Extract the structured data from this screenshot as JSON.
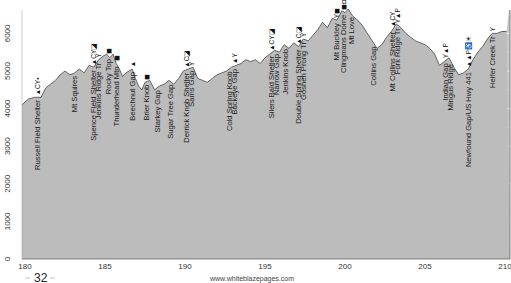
{
  "chart_data": {
    "type": "area",
    "title": "",
    "xlabel": "",
    "ylabel": "",
    "xlim": [
      180,
      210
    ],
    "ylim": [
      0,
      6400
    ],
    "x_ticks": [
      180,
      185,
      190,
      195,
      200,
      205,
      210
    ],
    "y_ticks": [
      0,
      1000,
      2000,
      3000,
      4000,
      5000,
      6000
    ],
    "grid": true,
    "grid_x_step": 1,
    "grid_y_step": 500,
    "fill_color": "#b9b9b9",
    "line_color": "#555555",
    "background_color": "#c8c8c8",
    "grid_color": "#e6e6e6",
    "profile": {
      "x": [
        179.8,
        180.2,
        180.6,
        181.0,
        181.3,
        181.6,
        181.9,
        182.2,
        182.5,
        182.8,
        183.1,
        183.4,
        183.7,
        184.0,
        184.3,
        184.6,
        184.9,
        185.1,
        185.3,
        185.5,
        185.7,
        185.9,
        186.1,
        186.3,
        186.5,
        186.7,
        186.9,
        187.1,
        187.3,
        187.5,
        187.8,
        188.1,
        188.4,
        188.7,
        189.0,
        189.3,
        189.6,
        189.9,
        190.2,
        190.5,
        190.8,
        191.1,
        191.4,
        191.7,
        192.0,
        192.3,
        192.6,
        192.9,
        193.2,
        193.5,
        193.8,
        194.1,
        194.4,
        194.7,
        195.0,
        195.3,
        195.6,
        195.9,
        196.2,
        196.5,
        196.8,
        197.1,
        197.4,
        197.7,
        198.0,
        198.3,
        198.6,
        198.9,
        199.2,
        199.5,
        199.8,
        200.0,
        200.2,
        200.5,
        200.8,
        201.1,
        201.4,
        201.7,
        202.0,
        202.3,
        202.6,
        202.9,
        203.2,
        203.5,
        203.8,
        204.1,
        204.4,
        204.7,
        205.0,
        205.3,
        205.6,
        205.9,
        206.2,
        206.5,
        206.8,
        207.1,
        207.4,
        207.7,
        208.0,
        208.3,
        208.6,
        208.9,
        209.2,
        209.5,
        209.8,
        210.1
      ],
      "elevation": [
        4100,
        4250,
        4300,
        4300,
        4550,
        4650,
        4750,
        4900,
        5000,
        4900,
        4950,
        5050,
        4950,
        5150,
        5100,
        5300,
        5400,
        5450,
        5350,
        5450,
        5200,
        5050,
        4850,
        4950,
        5000,
        5050,
        4800,
        4600,
        4500,
        4700,
        4750,
        4500,
        4600,
        4650,
        4750,
        4650,
        4800,
        5000,
        5050,
        5100,
        4800,
        4750,
        4700,
        4800,
        4900,
        4950,
        5000,
        5100,
        5150,
        5200,
        5300,
        5250,
        5300,
        5200,
        5350,
        5450,
        5550,
        5500,
        5700,
        5600,
        5750,
        5650,
        5850,
        5800,
        5950,
        6100,
        6300,
        6150,
        6400,
        6350,
        6600,
        6550,
        6650,
        6450,
        6350,
        6200,
        6000,
        5800,
        5600,
        5700,
        5900,
        6050,
        6250,
        6150,
        6000,
        5900,
        5800,
        5750,
        5700,
        5600,
        5450,
        5150,
        5250,
        5350,
        5100,
        4900,
        4950,
        5050,
        5300,
        5500,
        5650,
        5850,
        6000,
        6000,
        6050,
        6050
      ]
    },
    "landmarks": [
      {
        "mile": 180.8,
        "name": "Russell Field Shelter",
        "icons": "▲CY▪"
      },
      {
        "mile": 183.1,
        "name": "Mt Squires",
        "icons": ""
      },
      {
        "mile": 184.3,
        "name": "Spence Field Shelter",
        "icons": "▲CY◪"
      },
      {
        "mile": 184.6,
        "name": "Jenkins Ridge Tr",
        "icons": "Y"
      },
      {
        "mile": 185.2,
        "name": "Rocky Top",
        "icons": "◼"
      },
      {
        "mile": 185.7,
        "name": "Thunderhead Mtn",
        "icons": "◼"
      },
      {
        "mile": 186.7,
        "name": "Beechnut Gap",
        "icons": "▲"
      },
      {
        "mile": 187.6,
        "name": "Brier Knob",
        "icons": "◼"
      },
      {
        "mile": 188.3,
        "name": "Starkey Gap",
        "icons": ""
      },
      {
        "mile": 189.1,
        "name": "Sugar Tree Gap",
        "icons": ""
      },
      {
        "mile": 190.1,
        "name": "Derrick Knob Shelter",
        "icons": "▲C◪"
      },
      {
        "mile": 190.4,
        "name": "Sams Gap",
        "icons": "Y"
      },
      {
        "mile": 192.8,
        "name": "Cold Spring Knob",
        "icons": ""
      },
      {
        "mile": 193.1,
        "name": "Buckeye Gap",
        "icons": "▲Y"
      },
      {
        "mile": 195.4,
        "name": "Silers Bald Shelter",
        "icons": "▲CY◪"
      },
      {
        "mile": 195.7,
        "name": "Narrow Gap",
        "icons": ""
      },
      {
        "mile": 196.3,
        "name": "Jenkins Knob",
        "icons": ""
      },
      {
        "mile": 197.1,
        "name": "Double Spring Shelter",
        "icons": "▲C◪"
      },
      {
        "mile": 197.4,
        "name": "Goshen Prong Tr",
        "icons": "Y"
      },
      {
        "mile": 199.5,
        "name": "Mt Buckley",
        "icons": "Y◼"
      },
      {
        "mile": 199.9,
        "name": "Clingmans Dome",
        "icons": "◼◘Y♿P"
      },
      {
        "mile": 200.4,
        "name": "Mt Love",
        "icons": ""
      },
      {
        "mile": 201.8,
        "name": "Collins Gap",
        "icons": ""
      },
      {
        "mile": 203.0,
        "name": "Mt Collins Shelter",
        "icons": "▲CY"
      },
      {
        "mile": 203.3,
        "name": "Fork Ridge Tr",
        "icons": "Y▲P"
      },
      {
        "mile": 206.3,
        "name": "Indian Gap",
        "icons": "Y▲P"
      },
      {
        "mile": 206.6,
        "name": "Mingus Ridge",
        "icons": ""
      },
      {
        "mile": 207.7,
        "name": "Newfound Gap/US Hwy 441",
        "icons": "▲▲P♿☀"
      },
      {
        "mile": 209.2,
        "name": "Heifer Creek Tr",
        "icons": "Y"
      }
    ]
  },
  "footer": {
    "url": "www.whiteblazepages.com",
    "page_number": "32"
  }
}
